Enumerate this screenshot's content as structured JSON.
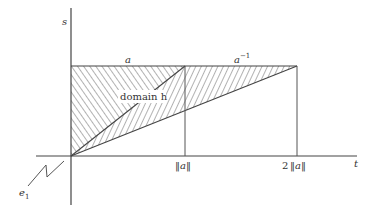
{
  "diagram": {
    "axes": {
      "vertical_label": "s",
      "horizontal_label": "t"
    },
    "top_edge_labels": {
      "left_segment": "a",
      "right_segment": "a",
      "right_segment_superscript": "−1"
    },
    "region_label": "domain h",
    "tick_labels": {
      "norm_a": "‖a‖",
      "two_norm_a_prefix": "2",
      "two_norm_a": "‖a‖"
    },
    "corner_label": "e",
    "corner_label_subscript": "1",
    "colors": {
      "line": "#444444",
      "hatch": "#555555",
      "background": "#ffffff"
    }
  }
}
